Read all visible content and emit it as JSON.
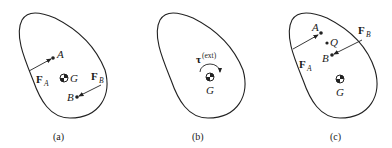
{
  "panels": [
    {
      "caption": "(a)",
      "points": {
        "A": "A",
        "B": "B",
        "G": "G"
      },
      "forces": [
        {
          "symbol": "F",
          "subscript": "A"
        },
        {
          "symbol": "F",
          "subscript": "B"
        }
      ]
    },
    {
      "caption": "(b)",
      "torque": {
        "symbol": "τ",
        "superscript": "(ext)"
      },
      "points": {
        "G": "G"
      }
    },
    {
      "caption": "(c)",
      "points": {
        "A": "A",
        "B": "B",
        "Q": "Q",
        "G": "G"
      },
      "forces": [
        {
          "symbol": "F",
          "subscript": "A"
        },
        {
          "symbol": "F",
          "subscript": "B"
        }
      ]
    }
  ]
}
